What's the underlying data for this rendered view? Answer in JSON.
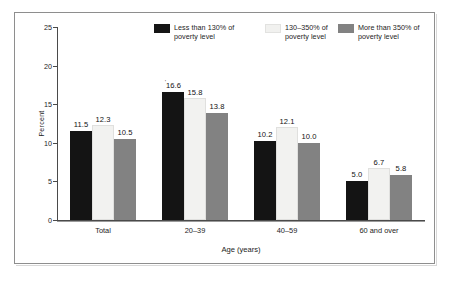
{
  "chart_data": {
    "type": "bar",
    "title": "",
    "xlabel": "Age (years)",
    "ylabel": "Percent",
    "ylim": [
      0,
      25
    ],
    "yticks": [
      "0",
      "5",
      "10",
      "15",
      "20",
      "25"
    ],
    "grid": false,
    "legend_position": "top",
    "categories": [
      "Total",
      "20–39",
      "40–59",
      "60 and over"
    ],
    "series": [
      {
        "name": "Less than 130% of\npoverty level",
        "color": "#141414",
        "values": [
          11.5,
          16.6,
          10.2,
          5.0
        ],
        "labels": [
          "11.5",
          "16.6",
          "10.2",
          "5.0"
        ],
        "label_footnotes": [
          "",
          "'",
          "",
          ""
        ]
      },
      {
        "name": "130–350% of\npoverty level",
        "color": "#f2f2f0",
        "values": [
          12.3,
          15.8,
          12.1,
          6.7
        ],
        "labels": [
          "12.3",
          "15.8",
          "12.1",
          "6.7"
        ],
        "label_footnotes": [
          "",
          "",
          "",
          ""
        ]
      },
      {
        "name": "More than 350% of\npoverty level",
        "color": "#828282",
        "values": [
          10.5,
          13.8,
          10.0,
          5.8
        ],
        "labels": [
          "10.5",
          "13.8",
          "10.0",
          "5.8"
        ],
        "label_footnotes": [
          "",
          "",
          "",
          ""
        ]
      }
    ]
  }
}
